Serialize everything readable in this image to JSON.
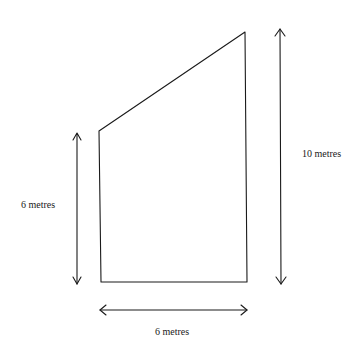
{
  "diagram": {
    "shape": "trapezium",
    "labels": {
      "left_height": "6 metres",
      "right_height": "10 metres",
      "base_width": "6 metres"
    },
    "colors": {
      "stroke": "#1a1a1a",
      "background": "#ffffff"
    }
  }
}
